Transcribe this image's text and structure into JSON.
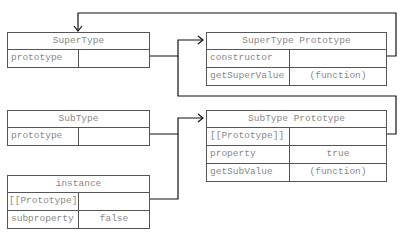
{
  "boxes": {
    "supertype": {
      "title": "SuperType",
      "rows": [
        {
          "key": "prototype",
          "value": ""
        }
      ]
    },
    "supertype_proto": {
      "title": "SuperType Prototype",
      "rows": [
        {
          "key": "constructor",
          "value": ""
        },
        {
          "key": "getSuperValue",
          "value": "(function)"
        }
      ]
    },
    "subtype": {
      "title": "SubType",
      "rows": [
        {
          "key": "prototype",
          "value": ""
        }
      ]
    },
    "subtype_proto": {
      "title": "SubType Prototype",
      "rows": [
        {
          "key": "[[Prototype]]",
          "value": ""
        },
        {
          "key": "property",
          "value": "true"
        },
        {
          "key": "getSubValue",
          "value": "(function)"
        }
      ]
    },
    "instance": {
      "title": "instance",
      "rows": [
        {
          "key": "[[Prototype]]",
          "value": ""
        },
        {
          "key": "subproperty",
          "value": "false"
        }
      ]
    }
  },
  "colors": {
    "line": "#111111",
    "border": "#555555",
    "text": "#888888"
  }
}
